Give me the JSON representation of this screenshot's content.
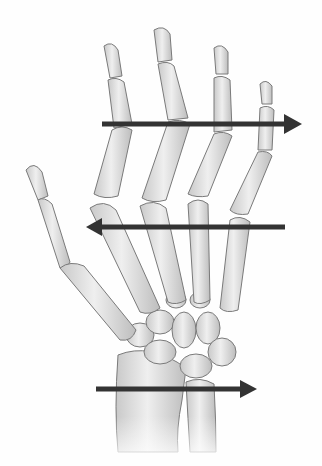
{
  "figure": {
    "background": "#fefefe",
    "bone_fill": "#e2e2e2",
    "bone_stroke": "#7a7a7a",
    "arrow_color": "#333333"
  },
  "arrows": [
    {
      "name": "phalanges-arrow",
      "direction": "right",
      "x1": 102,
      "x2": 300,
      "y": 124
    },
    {
      "name": "metacarpal-heads-arrow",
      "direction": "left",
      "x1": 285,
      "x2": 86,
      "y": 227
    },
    {
      "name": "radioulnar-arrow",
      "direction": "right",
      "x1": 96,
      "x2": 256,
      "y": 389
    }
  ]
}
